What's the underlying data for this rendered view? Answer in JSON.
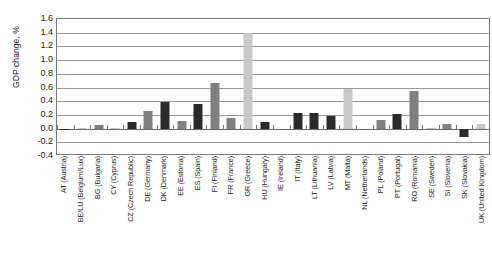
{
  "chart_data": {
    "type": "bar",
    "title": "",
    "xlabel": "",
    "ylabel": "GDP change, %",
    "ylim": [
      -0.4,
      1.6
    ],
    "ytick_step": 0.2,
    "grid": true,
    "legend": "none",
    "orientation": "vertical",
    "xtick_rotation": -90,
    "colors": {
      "light": "#c9c9c9",
      "dark": "#2b2b2b",
      "medium": "#808080",
      "axis": "#7a7a7a",
      "grid": "#9a9a9a",
      "text": "#1a1a1a",
      "background": "#ffffff"
    },
    "ytick_labels": [
      "1.6",
      "1.4",
      "1.2",
      "1.0",
      "0.8",
      "0.6",
      "0.4",
      "0.2",
      "0.0",
      "-0.2",
      "-0.4"
    ],
    "ytick_values": [
      1.6,
      1.4,
      1.2,
      1.0,
      0.8,
      0.6,
      0.4,
      0.2,
      0.0,
      -0.2,
      -0.4
    ],
    "categories": [
      "AT (Austria)",
      "BE/LU (Belgium/Lux)",
      "BG (Bulgaria)",
      "CY (Cyprus)",
      "CZ (Czech Republic)",
      "DE (Germany)",
      "DK (Denmark)",
      "EE (Estonia)",
      "ES (Spain)",
      "FI (Finland)",
      "FR (France)",
      "GR (Greece)",
      "HU (Hungary)",
      "IE (Ireland)",
      "IT (Italy)",
      "LT (Lithuania)",
      "LV (Latvia)",
      "MT (Malta)",
      "NL (Netherlands)",
      "PL (Poland)",
      "PT (Portugal)",
      "RO (Romania)",
      "SE (Sweden)",
      "SI (Slovenia)",
      "SK (Slovakia)",
      "UK (United Kingdom)"
    ],
    "values": [
      -0.02,
      0.01,
      0.05,
      0.01,
      0.09,
      0.25,
      0.39,
      0.11,
      0.36,
      0.67,
      0.15,
      1.4,
      0.09,
      0.0,
      0.23,
      0.23,
      0.19,
      0.58,
      0.0,
      0.12,
      0.21,
      0.55,
      0.01,
      0.07,
      -0.13,
      0.06
    ],
    "shades": [
      "dark",
      "light",
      "medium",
      "light",
      "dark",
      "medium",
      "dark",
      "medium",
      "dark",
      "medium",
      "medium",
      "light",
      "dark",
      "light",
      "dark",
      "dark",
      "dark",
      "light",
      "light",
      "medium",
      "dark",
      "medium",
      "light",
      "medium",
      "dark",
      "light"
    ]
  }
}
